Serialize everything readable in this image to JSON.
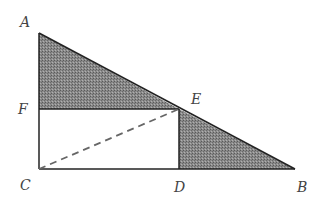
{
  "diagram": {
    "type": "geometry",
    "points": {
      "A": {
        "label": "A",
        "x": 39,
        "y": 33
      },
      "F": {
        "label": "F",
        "x": 39,
        "y": 109
      },
      "C": {
        "label": "C",
        "x": 39,
        "y": 169
      },
      "D": {
        "label": "D",
        "x": 179,
        "y": 169
      },
      "B": {
        "label": "B",
        "x": 295,
        "y": 169
      },
      "E": {
        "label": "E",
        "x": 179,
        "y": 109
      }
    },
    "labels": {
      "A": "A",
      "B": "B",
      "C": "C",
      "D": "D",
      "E": "E",
      "F": "F"
    },
    "shaded_regions": [
      "AFE",
      "EDB"
    ],
    "dashed_segments": [
      "CE"
    ],
    "colors": {
      "stroke": "#222222",
      "shade": "#7a7a7a",
      "dash": "#666666",
      "label": "#444444"
    }
  }
}
